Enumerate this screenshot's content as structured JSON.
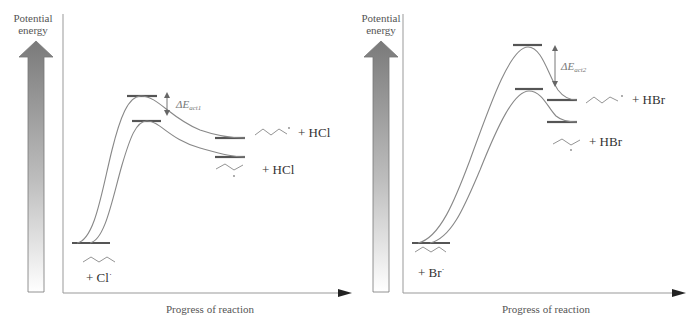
{
  "panels": [
    {
      "id": "chlorination",
      "y_axis_label_line1": "Potential",
      "y_axis_label_line2": "energy",
      "x_axis_label": "Progress of reaction",
      "reactant_label": "+ Cl",
      "reactant_radical_dot": "·",
      "product_upper_label": "+ HCl",
      "product_lower_label": "+ HCl",
      "delta_label": "ΔE",
      "delta_subscript": "act1",
      "colors": {
        "curve": "#888888",
        "level": "#555555",
        "axis": "#999999",
        "arrow_head": "#222222",
        "delta_arrow": "#666666"
      }
    },
    {
      "id": "bromination",
      "y_axis_label_line1": "Potential",
      "y_axis_label_line2": "energy",
      "x_axis_label": "Progress of reaction",
      "reactant_label": "+ Br",
      "reactant_radical_dot": "·",
      "product_upper_label": "+ HBr",
      "product_lower_label": "+ HBr",
      "delta_label": "ΔE",
      "delta_subscript": "act2",
      "colors": {
        "curve": "#888888",
        "level": "#555555",
        "axis": "#999999",
        "arrow_head": "#222222",
        "delta_arrow": "#666666"
      }
    }
  ]
}
